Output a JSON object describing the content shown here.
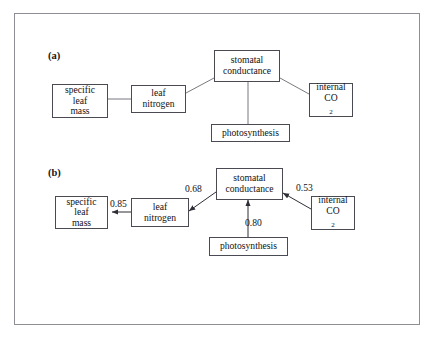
{
  "running_head": {
    "text": "",
    "visible": false
  },
  "figure": {
    "frame": {
      "border_color": "#8e8e94",
      "background": "#ffffff"
    },
    "line_color": "#55555d",
    "text_color": "#111116"
  },
  "panels": [
    {
      "id": "a",
      "label": "(a)",
      "nodes": [
        {
          "id": "specific-leaf-mass",
          "lines": [
            "specific",
            "leaf",
            "mass"
          ]
        },
        {
          "id": "leaf-nitrogen",
          "lines": [
            "leaf",
            "nitrogen"
          ]
        },
        {
          "id": "stomatal-conductance",
          "lines": [
            "stomatal",
            "conductance"
          ]
        },
        {
          "id": "photosynthesis",
          "lines": [
            "photosynthesis"
          ]
        },
        {
          "id": "internal-co2",
          "lines": [
            "internal",
            "CO2"
          ]
        }
      ],
      "edges": [
        {
          "from": "specific-leaf-mass",
          "to": "leaf-nitrogen",
          "arrow": false,
          "coefficient": ""
        },
        {
          "from": "leaf-nitrogen",
          "to": "stomatal-conductance",
          "arrow": false,
          "coefficient": ""
        },
        {
          "from": "stomatal-conductance",
          "to": "photosynthesis",
          "arrow": false,
          "coefficient": ""
        },
        {
          "from": "stomatal-conductance",
          "to": "internal-co2",
          "arrow": false,
          "coefficient": ""
        }
      ]
    },
    {
      "id": "b",
      "label": "(b)",
      "nodes": [
        {
          "id": "specific-leaf-mass",
          "lines": [
            "specific",
            "leaf",
            "mass"
          ]
        },
        {
          "id": "leaf-nitrogen",
          "lines": [
            "leaf",
            "nitrogen"
          ]
        },
        {
          "id": "stomatal-conductance",
          "lines": [
            "stomatal",
            "conductance"
          ]
        },
        {
          "id": "photosynthesis",
          "lines": [
            "photosynthesis"
          ]
        },
        {
          "id": "internal-co2",
          "lines": [
            "internal",
            "CO2"
          ]
        }
      ],
      "edges": [
        {
          "from": "leaf-nitrogen",
          "to": "specific-leaf-mass",
          "arrow": true,
          "coefficient": "0.85"
        },
        {
          "from": "stomatal-conductance",
          "to": "leaf-nitrogen",
          "arrow": true,
          "coefficient": "0.68"
        },
        {
          "from": "photosynthesis",
          "to": "stomatal-conductance",
          "arrow": true,
          "coefficient": "0.80"
        },
        {
          "from": "internal-co2",
          "to": "stomatal-conductance",
          "arrow": true,
          "coefficient": "0.53"
        }
      ]
    }
  ],
  "labels": {
    "specific": "specific",
    "leaf": "leaf",
    "mass": "mass",
    "leaf_word": "leaf",
    "nitrogen": "nitrogen",
    "stomatal": "stomatal",
    "conductance": "conductance",
    "photosynthesis": "photosynthesis",
    "internal": "internal",
    "co2_main": "CO",
    "co2_sub": "2"
  },
  "coefficients": {
    "sn_to_slm": "0.85",
    "sc_to_ln": "0.68",
    "ps_to_sc": "0.80",
    "ico2_to_sc": "0.53"
  }
}
